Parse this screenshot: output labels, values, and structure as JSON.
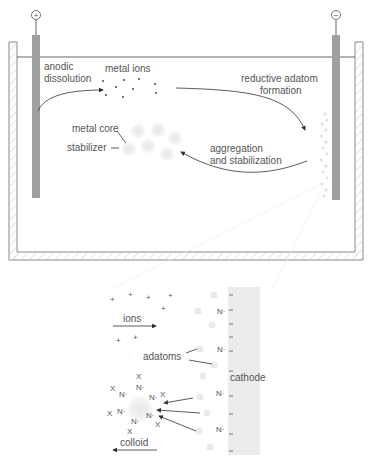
{
  "top_cell": {
    "anode_symbol": "+",
    "cathode_symbol": "−",
    "labels": {
      "anodic_dissolution_1": "anodic",
      "anodic_dissolution_2": "dissolution",
      "metal_ions": "metal ions",
      "reductive_1": "reductive adatom",
      "reductive_2": "formation",
      "metal_core": "metal core",
      "stabilizer": "stabilizer",
      "aggregation_1": "aggregation",
      "aggregation_2": "and stabilization"
    }
  },
  "inset": {
    "labels": {
      "ions": "ions",
      "adatoms": "adatoms",
      "cathode": "cathode",
      "colloid": "colloid"
    },
    "ion_symbol": "+",
    "stabilizer_symbol": "N·",
    "counterion_symbol": "X",
    "surface_charge_symbol": "−"
  },
  "colors": {
    "electrode": "#a0a0a0",
    "outline": "#888888",
    "text": "#555555",
    "cathode_surface": "#ececec"
  }
}
